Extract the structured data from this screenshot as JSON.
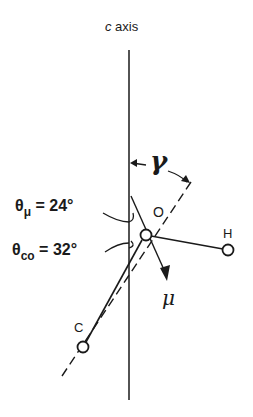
{
  "diagram": {
    "axis_label_italic": "c",
    "axis_label_rest": " axis",
    "theta_mu": {
      "symbol": "θ",
      "subscript": "μ",
      "value": " = 24°"
    },
    "theta_co": {
      "symbol": "θ",
      "subscript": "co",
      "value": " = 32°"
    },
    "atoms": {
      "O": "O",
      "H": "H",
      "C": "C"
    },
    "dipole_label": "μ",
    "angle_label": "γ",
    "colors": {
      "ink": "#1a1a1a",
      "background": "#ffffff"
    }
  }
}
